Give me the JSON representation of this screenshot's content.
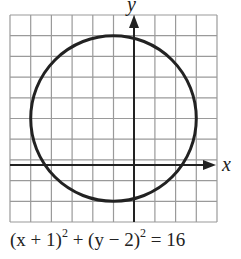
{
  "diagram": {
    "type": "circle-on-grid",
    "axes": {
      "x_label": "x",
      "y_label": "y"
    },
    "grid": {
      "x_min": -6,
      "x_max": 4,
      "y_min": -3,
      "y_max": 7,
      "step": 1
    },
    "circle": {
      "center": [
        -1,
        2
      ],
      "radius": 4
    },
    "equation": {
      "part1": "(x + 1)",
      "exp1": "2",
      "part2": " + (y − 2)",
      "exp2": "2",
      "part3": " = 16"
    },
    "colors": {
      "grid": "#9a9a9a",
      "curve": "#222222",
      "axis": "#222222"
    }
  }
}
